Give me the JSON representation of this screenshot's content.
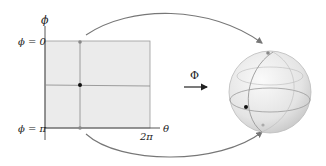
{
  "diagram": {
    "domain_plane": {
      "axis_vertical_label": "ϕ",
      "axis_horizontal_label": "θ",
      "top_label": "ϕ = 0",
      "bottom_label": "ϕ = π",
      "right_tick_label": "2π",
      "fill_color": "#ebebeb",
      "border_color": "#999999"
    },
    "map": {
      "label": "Φ"
    },
    "sphere": {
      "fill_color": "#e6e6e6",
      "line_color": "#a0a0a0"
    },
    "colors": {
      "arrow": "#777777",
      "point": "#111111",
      "pole_point": "#888888"
    }
  }
}
